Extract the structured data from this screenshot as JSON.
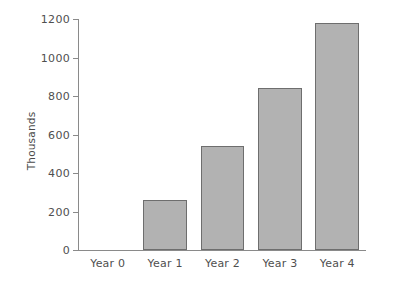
{
  "chart_data": {
    "type": "bar",
    "title": "",
    "xlabel": "",
    "ylabel": "Thousands",
    "categories": [
      "Year 0",
      "Year 1",
      "Year 2",
      "Year 3",
      "Year 4"
    ],
    "values": [
      0,
      260,
      540,
      840,
      1180
    ],
    "ylim": [
      0,
      1200
    ],
    "ytick_labels": [
      "0",
      "200",
      "400",
      "600",
      "800",
      "1000",
      "1200"
    ],
    "yticks": [
      0,
      200,
      400,
      600,
      800,
      1000,
      1200
    ],
    "grid": false,
    "legend": null,
    "bar_fill_color": "#b2b2b2",
    "bar_edge_color": "#6e6e6e",
    "axis_color": "#8a8a8a",
    "background_color": "#ffffff",
    "text_color": "#4f4f4f"
  }
}
